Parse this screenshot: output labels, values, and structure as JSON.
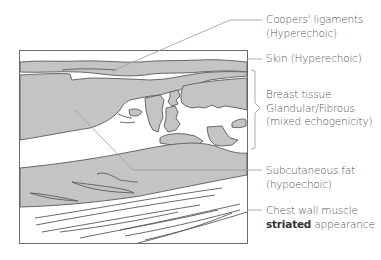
{
  "colors": {
    "tissue_fill": "#c4c4c4",
    "outline": "#5a5a5a",
    "leader": "#9a9a9a",
    "text": "#555555"
  },
  "labels": [
    {
      "id": "coopers",
      "line1": "Coopers' ligaments",
      "line2": "(Hyperechoic)"
    },
    {
      "id": "skin",
      "line1": "Skin (Hyperechoic)"
    },
    {
      "id": "breast",
      "line1": "Breast tissue",
      "line2": "Glandular/Fibrous",
      "line3": "(mixed echogenicity)"
    },
    {
      "id": "fat",
      "line1": "Subcutaneous fat",
      "line2": "(hypoechoic)"
    },
    {
      "id": "muscle",
      "line1": "Chest wall muscle",
      "line2_bold": "striated",
      "line2_rest": " appearance"
    }
  ]
}
